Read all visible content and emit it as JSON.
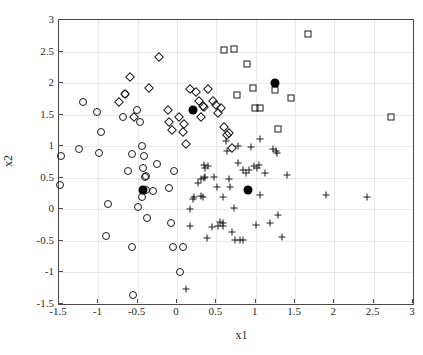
{
  "chart_data": {
    "type": "scatter",
    "title": "",
    "xlabel": "x1",
    "ylabel": "x2",
    "xlim": [
      -1.5,
      3
    ],
    "ylim": [
      -1.5,
      3
    ],
    "xticks": [
      -1.5,
      -1,
      -0.5,
      0,
      0.5,
      1,
      1.5,
      2,
      2.5,
      3
    ],
    "xticklabels": [
      "-1.5",
      "-1",
      "-0.5",
      "0",
      "0.5",
      "1",
      "1.5",
      "2",
      "2.5",
      "3"
    ],
    "yticks": [
      -1.5,
      -1,
      -0.5,
      0,
      0.5,
      1,
      1.5,
      2,
      2.5,
      3
    ],
    "yticklabels": [
      "-1.5",
      "-1",
      "-0.5",
      "0",
      "0.5",
      "1",
      "1.5",
      "2",
      "2.5",
      "3"
    ],
    "grid": true,
    "legend": null,
    "marker_color": "#1a1a1a",
    "centroid_color": "#000000",
    "background": "#ffffff",
    "series": [
      {
        "name": "cluster-circles",
        "marker": "circle",
        "points": [
          [
            -1.48,
            0.84
          ],
          [
            -1.49,
            0.38
          ],
          [
            -1.24,
            0.95
          ],
          [
            -1.19,
            1.7
          ],
          [
            -1.02,
            1.55
          ],
          [
            -0.99,
            0.9
          ],
          [
            -0.96,
            1.23
          ],
          [
            -0.88,
            0.08
          ],
          [
            -0.9,
            -0.42
          ],
          [
            -0.69,
            1.47
          ],
          [
            -0.62,
            0.6
          ],
          [
            -0.57,
            0.88
          ],
          [
            -0.57,
            -0.59
          ],
          [
            -0.56,
            -1.36
          ],
          [
            -0.51,
            1.58
          ],
          [
            -0.49,
            0.04
          ],
          [
            -0.47,
            1.38
          ],
          [
            -0.45,
            0.2
          ],
          [
            -0.44,
            1.0
          ],
          [
            -0.43,
            0.66
          ],
          [
            -0.42,
            0.85
          ],
          [
            -0.41,
            0.51
          ],
          [
            -0.4,
            0.53
          ],
          [
            -0.39,
            0.3
          ],
          [
            -0.38,
            -0.13
          ],
          [
            -0.3,
            0.29
          ],
          [
            -0.26,
            0.72
          ],
          [
            -0.1,
            0.34
          ],
          [
            -0.08,
            -0.22
          ],
          [
            -0.05,
            -0.59
          ],
          [
            -0.04,
            0.6
          ],
          [
            0.04,
            -1.0
          ],
          [
            0.08,
            -0.59
          ],
          [
            -0.66,
            1.82
          ]
        ]
      },
      {
        "name": "cluster-diamonds",
        "marker": "diamond",
        "points": [
          [
            -0.74,
            1.7
          ],
          [
            -0.66,
            1.82
          ],
          [
            -0.6,
            2.1
          ],
          [
            -0.55,
            1.47
          ],
          [
            -0.36,
            1.92
          ],
          [
            -0.23,
            2.41
          ],
          [
            -0.12,
            1.58
          ],
          [
            -0.1,
            1.38
          ],
          [
            -0.06,
            1.26
          ],
          [
            0.03,
            1.46
          ],
          [
            0.08,
            1.22
          ],
          [
            0.09,
            1.36
          ],
          [
            0.12,
            1.04
          ],
          [
            0.16,
            1.91
          ],
          [
            0.24,
            1.86
          ],
          [
            0.28,
            1.71
          ],
          [
            0.33,
            1.63
          ],
          [
            0.34,
            1.62
          ],
          [
            0.4,
            1.9
          ],
          [
            0.46,
            1.72
          ],
          [
            0.5,
            1.65
          ],
          [
            0.52,
            1.52
          ],
          [
            0.56,
            1.6
          ],
          [
            0.6,
            1.3
          ],
          [
            0.63,
            1.18
          ],
          [
            0.66,
            1.21
          ],
          [
            0.7,
            0.97
          ],
          [
            0.3,
            1.47
          ]
        ]
      },
      {
        "name": "cluster-squares",
        "marker": "square",
        "points": [
          [
            0.6,
            2.52
          ],
          [
            0.72,
            2.54
          ],
          [
            0.89,
            2.31
          ],
          [
            0.76,
            1.81
          ],
          [
            0.96,
            1.93
          ],
          [
            0.99,
            1.6
          ],
          [
            1.06,
            1.6
          ],
          [
            1.25,
            1.89
          ],
          [
            1.28,
            1.28
          ],
          [
            1.45,
            1.76
          ],
          [
            1.66,
            2.78
          ],
          [
            2.72,
            1.47
          ]
        ]
      },
      {
        "name": "cluster-plus",
        "marker": "plus",
        "points": [
          [
            0.34,
            0.7
          ],
          [
            0.36,
            0.66
          ],
          [
            0.4,
            0.68
          ],
          [
            0.3,
            0.48
          ],
          [
            0.34,
            0.5
          ],
          [
            0.36,
            0.51
          ],
          [
            0.27,
            0.41
          ],
          [
            0.22,
            0.19
          ],
          [
            0.3,
            0.21
          ],
          [
            0.33,
            0.2
          ],
          [
            0.2,
            0.16
          ],
          [
            0.17,
            -0.26
          ],
          [
            0.17,
            0.0
          ],
          [
            0.11,
            -1.27
          ],
          [
            0.38,
            -0.45
          ],
          [
            0.44,
            -0.28
          ],
          [
            0.47,
            0.52
          ],
          [
            0.51,
            0.36
          ],
          [
            0.52,
            -0.27
          ],
          [
            0.55,
            -0.2
          ],
          [
            0.58,
            -0.21
          ],
          [
            0.59,
            -0.26
          ],
          [
            0.59,
            0.19
          ],
          [
            0.62,
            1.08
          ],
          [
            0.64,
            0.92
          ],
          [
            0.66,
            0.48
          ],
          [
            0.68,
            0.36
          ],
          [
            0.7,
            -0.36
          ],
          [
            0.72,
            0.02
          ],
          [
            0.74,
            -0.48
          ],
          [
            0.77,
            1.0
          ],
          [
            0.78,
            0.74
          ],
          [
            0.8,
            -0.48
          ],
          [
            0.84,
            -0.49
          ],
          [
            0.84,
            0.62
          ],
          [
            0.88,
            0.58
          ],
          [
            0.92,
            0.63
          ],
          [
            0.98,
            0.68
          ],
          [
            1.0,
            -0.25
          ],
          [
            1.02,
            0.65
          ],
          [
            1.04,
            0.7
          ],
          [
            1.06,
            1.12
          ],
          [
            1.12,
            0.58
          ],
          [
            1.18,
            -0.21
          ],
          [
            1.22,
            0.95
          ],
          [
            1.26,
            0.92
          ],
          [
            1.28,
            -0.09
          ],
          [
            1.33,
            -0.44
          ],
          [
            1.4,
            0.55
          ],
          [
            1.05,
            0.23
          ],
          [
            0.94,
            0.98
          ],
          [
            1.27,
            0.9
          ],
          [
            1.9,
            0.22
          ],
          [
            2.42,
            0.19
          ]
        ]
      },
      {
        "name": "centroids",
        "marker": "filled-circle",
        "points": [
          [
            -0.43,
            0.31
          ],
          [
            0.2,
            1.58
          ],
          [
            0.9,
            0.31
          ],
          [
            1.25,
            2.0
          ]
        ]
      }
    ]
  }
}
